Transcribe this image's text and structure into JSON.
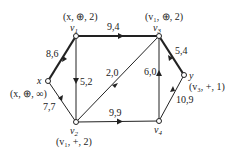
{
  "graph": {
    "nodes": [
      {
        "id": "x",
        "label": "x",
        "tag": "(x, ⊕, ∞)",
        "px": 48,
        "py": 81
      },
      {
        "id": "v1",
        "label": "v1",
        "tag": "(x, ⊕, 2)",
        "px": 76,
        "py": 36
      },
      {
        "id": "v2",
        "label": "v2",
        "tag": "(v1, +, 2)",
        "px": 76,
        "py": 122
      },
      {
        "id": "v3",
        "label": "v3",
        "tag": "(v1, ⊕, 2)",
        "px": 159,
        "py": 36
      },
      {
        "id": "v4",
        "label": "v4",
        "tag": "",
        "px": 159,
        "py": 121
      },
      {
        "id": "y",
        "label": "y",
        "tag": "(v3, +, 1)",
        "px": 184,
        "py": 75
      }
    ],
    "edges": [
      {
        "from": "x",
        "to": "v1",
        "label": "8,6",
        "bold": true
      },
      {
        "from": "x",
        "to": "v2",
        "label": "7,7",
        "bold": false
      },
      {
        "from": "v1",
        "to": "v3",
        "label": "9,4",
        "bold": true
      },
      {
        "from": "v1",
        "to": "v2",
        "label": "5,2",
        "bold": false
      },
      {
        "from": "v3",
        "to": "v2",
        "label": "2,0",
        "bold": false
      },
      {
        "from": "v3",
        "to": "y",
        "label": "5,4",
        "bold": true
      },
      {
        "from": "v2",
        "to": "v4",
        "label": "9,9",
        "bold": false
      },
      {
        "from": "v4",
        "to": "v3",
        "label": "6,0",
        "bold": false
      },
      {
        "from": "v4",
        "to": "y",
        "label": "10,9",
        "bold": false
      }
    ]
  },
  "labels": {
    "x": "x",
    "y": "y",
    "v1": "v",
    "v1_sub": "1",
    "v2": "v",
    "v2_sub": "2",
    "v3": "v",
    "v3_sub": "3",
    "v4": "v",
    "v4_sub": "4",
    "x_tag": "(x, ⊕, ∞)",
    "v1_tag": "(x, ⊕, 2)",
    "v2_tag": "(v₁, +, 2)",
    "v3_tag": "(v₁, ⊕, 2)",
    "y_tag": "(v₃, +, 1)",
    "e_x_v1": "8,6",
    "e_x_v2": "7,7",
    "e_v1_v3": "9,4",
    "e_v1_v2": "5,2",
    "e_v3_v2": "2,0",
    "e_v3_y": "5,4",
    "e_v2_v4": "9,9",
    "e_v4_v3": "6,0",
    "e_v4_y": "10,9"
  }
}
